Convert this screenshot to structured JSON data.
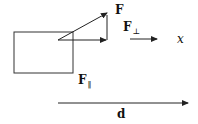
{
  "diagram": {
    "type": "force-work-diagram",
    "labels": {
      "force": "F",
      "perp_main": "F",
      "perp_sub": "⊥",
      "parallel_main": "F",
      "parallel_sub": "‖",
      "axis": "x",
      "displacement": "d"
    },
    "elements": [
      {
        "id": "block",
        "shape": "rectangle"
      },
      {
        "id": "force-vector",
        "shape": "arrow",
        "label": "F"
      },
      {
        "id": "horizontal-component",
        "shape": "arrow"
      },
      {
        "id": "vertical-component",
        "shape": "line"
      },
      {
        "id": "x-direction-arrow",
        "shape": "arrow",
        "label": "x"
      },
      {
        "id": "displacement-arrow",
        "shape": "arrow",
        "label": "d"
      }
    ],
    "colors": {
      "stroke": "#222222",
      "background": "#ffffff"
    }
  }
}
